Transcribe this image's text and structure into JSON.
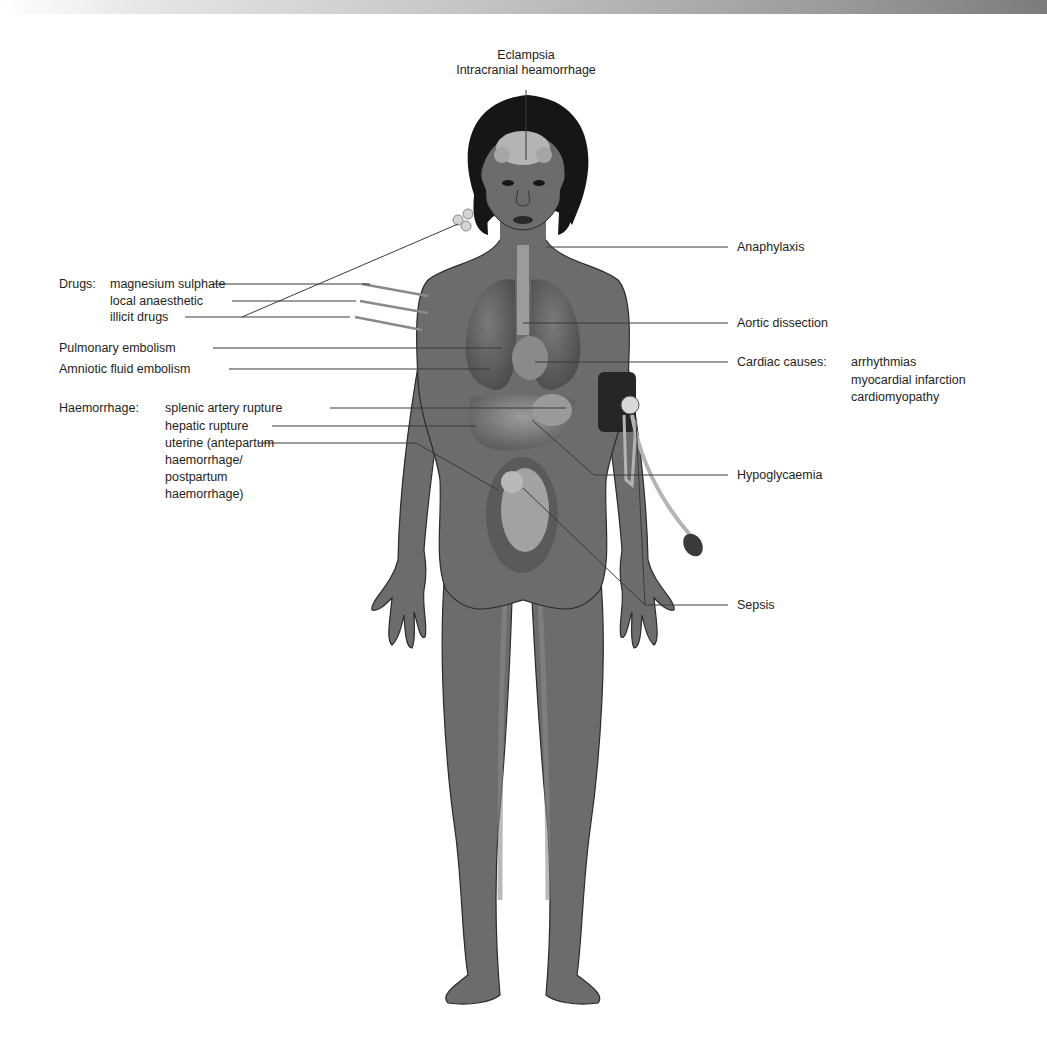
{
  "diagram": {
    "colors": {
      "background": "#ffffff",
      "skin": "#6c6c6c",
      "skin_shadow": "#575757",
      "organs": "#8a8a8a",
      "organs_light": "#b4b4b4",
      "hair": "#161616",
      "leader_line": "#3a3a3a",
      "text": "#1e1e1e"
    },
    "top_labels": {
      "line1": "Eclampsia",
      "line2": "Intracranial heamorrhage"
    },
    "left_labels": {
      "drugs": {
        "heading": "Drugs:",
        "items": [
          "magnesium sulphate",
          "local anaesthetic",
          "illicit drugs"
        ]
      },
      "pulmonary_embolism": "Pulmonary embolism",
      "amniotic_fluid_embolism": "Amniotic fluid embolism",
      "haemorrhage": {
        "heading": "Haemorrhage:",
        "items": [
          "splenic artery rupture",
          "hepatic rupture",
          "uterine (antepartum",
          "haemorrhage/",
          "postpartum",
          "haemorrhage)"
        ]
      }
    },
    "right_labels": {
      "anaphylaxis": "Anaphylaxis",
      "aortic_dissection": "Aortic dissection",
      "cardiac": {
        "heading": "Cardiac causes:",
        "items": [
          "arrhythmias",
          "myocardial infarction",
          "cardiomyopathy"
        ]
      },
      "hypoglycaemia": "Hypoglycaemia",
      "sepsis": "Sepsis"
    },
    "illustrated_objects": [
      "woman-figure",
      "brain",
      "lungs",
      "heart",
      "liver",
      "stomach",
      "uterus-with-fetus",
      "syringes",
      "blood-pressure-cuff",
      "allergen-pollen"
    ]
  }
}
